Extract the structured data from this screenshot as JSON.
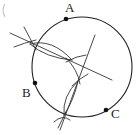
{
  "diagram": {
    "type": "geometric-construction",
    "circle": {
      "cx": 82,
      "cy": 67,
      "r": 50
    },
    "points": [
      {
        "id": "A",
        "label": "A",
        "x": 66,
        "y": 19,
        "label_x": 65,
        "label_y": 12
      },
      {
        "id": "B",
        "label": "B",
        "x": 35,
        "y": 83,
        "label_x": 22,
        "label_y": 97
      },
      {
        "id": "C",
        "label": "C",
        "x": 106,
        "y": 110,
        "label_x": 111,
        "label_y": 118
      }
    ],
    "bisectors": [
      {
        "id": "bisector-AB",
        "from": [
          10,
          33
        ],
        "to": [
          112,
          80
        ]
      },
      {
        "id": "bisector-BC",
        "from": [
          95,
          35
        ],
        "to": [
          60,
          130
        ]
      }
    ],
    "colors": {
      "line": "#222222",
      "point": "#111111",
      "background": "#ffffff"
    }
  }
}
